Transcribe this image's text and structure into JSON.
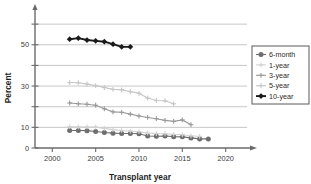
{
  "chart_data": {
    "type": "line",
    "title": "",
    "xlabel": "Transplant year",
    "ylabel": "Percent",
    "xlim": [
      1998,
      2022
    ],
    "ylim": [
      0,
      62
    ],
    "xticks": [
      2000,
      2005,
      2010,
      2015,
      2020
    ],
    "xtick_labels": [
      "2000",
      "2005",
      "2010",
      "2015",
      "2020"
    ],
    "yticks": [
      0,
      10,
      20,
      30,
      40,
      50,
      60
    ],
    "ytick_labels": [
      "0",
      "",
      "10",
      "",
      "30",
      "",
      "50"
    ],
    "ytick_labeled": [
      0,
      10,
      30,
      50
    ],
    "grid": "horizontal",
    "legend_position": "right",
    "series": [
      {
        "name": "6-month",
        "color": "#6e6e6e",
        "marker": "circle",
        "x": [
          2002,
          2003,
          2004,
          2005,
          2006,
          2007,
          2008,
          2009,
          2010,
          2011,
          2012,
          2013,
          2014,
          2015,
          2016,
          2017,
          2018
        ],
        "values": [
          8.5,
          8.5,
          8.4,
          8.0,
          7.5,
          7.2,
          7.0,
          7.0,
          6.9,
          5.8,
          5.7,
          5.8,
          5.5,
          5.4,
          4.9,
          4.4,
          4.4
        ]
      },
      {
        "name": "1-year",
        "color": "#d2d2d2",
        "marker": "plus",
        "x": [
          2002,
          2003,
          2004,
          2005,
          2006,
          2007,
          2008,
          2009,
          2010,
          2011,
          2012,
          2013,
          2014,
          2015,
          2016,
          2017
        ],
        "values": [
          10.4,
          10.2,
          10.2,
          10.1,
          9.5,
          8.9,
          8.5,
          8.2,
          7.9,
          7.2,
          7.0,
          6.9,
          6.6,
          6.4,
          5.9,
          5.6
        ]
      },
      {
        "name": "3-year",
        "color": "#9a9a9a",
        "marker": "plus",
        "x": [
          2002,
          2003,
          2004,
          2005,
          2006,
          2007,
          2008,
          2009,
          2010,
          2011,
          2012,
          2013,
          2014,
          2015,
          2016
        ],
        "values": [
          21.8,
          21.4,
          21.2,
          20.7,
          19.0,
          17.5,
          17.3,
          16.4,
          15.5,
          14.8,
          14.2,
          13.4,
          12.9,
          13.6,
          11.3
        ]
      },
      {
        "name": "5-year",
        "color": "#c6c6c6",
        "marker": "plus",
        "x": [
          2002,
          2003,
          2004,
          2005,
          2006,
          2007,
          2008,
          2009,
          2010,
          2011,
          2012,
          2013,
          2014
        ],
        "values": [
          31.7,
          31.6,
          31.0,
          30.2,
          29.3,
          28.4,
          28.2,
          27.3,
          26.5,
          24.2,
          23.0,
          22.9,
          21.4
        ]
      },
      {
        "name": "10-year",
        "color": "#1a1a1a",
        "marker": "diamond",
        "x": [
          2002,
          2003,
          2004,
          2005,
          2006,
          2007,
          2008,
          2009
        ],
        "values": [
          52.7,
          53.2,
          52.3,
          51.9,
          51.5,
          50.3,
          49.0,
          49.0
        ]
      }
    ]
  },
  "legend": {
    "entries": [
      {
        "label": "6-month"
      },
      {
        "label": "1-year"
      },
      {
        "label": "3-year"
      },
      {
        "label": "5-year"
      },
      {
        "label": "10-year"
      }
    ]
  }
}
